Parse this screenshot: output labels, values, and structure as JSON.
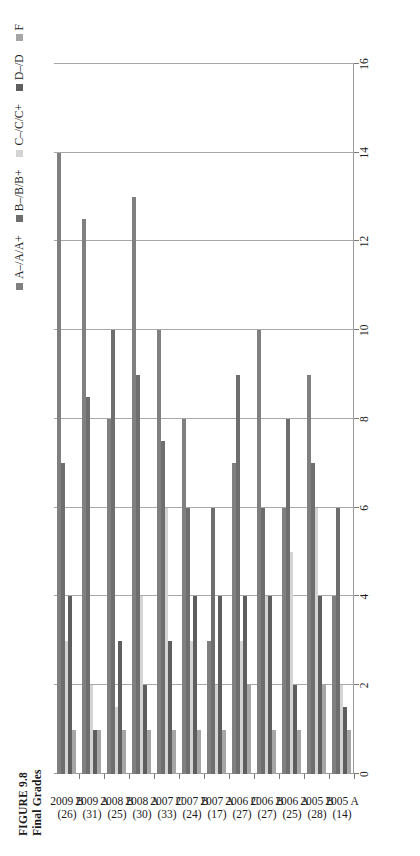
{
  "figure": {
    "number_label": "FIGURE 9.8",
    "title": "Final Grades"
  },
  "legend": {
    "position": "top-right",
    "items": [
      {
        "label": "A–/A/A+",
        "color": "#808080"
      },
      {
        "label": "B–/B/B+",
        "color": "#6e6e6e"
      },
      {
        "label": "C–/C/C+",
        "color": "#d4d4d4"
      },
      {
        "label": "D–/D",
        "color": "#5e5e5e"
      },
      {
        "label": "F",
        "color": "#a6a6a6"
      }
    ]
  },
  "axes": {
    "value_axis_ticks": [
      "0",
      "2",
      "4",
      "6",
      "8",
      "10",
      "12",
      "14",
      "16"
    ],
    "value_axis_min": 0,
    "value_axis_max": 16,
    "value_axis_step": 2,
    "grid": true,
    "orientation": "rotated-90"
  },
  "chart_data": {
    "type": "bar",
    "title": "Final Grades",
    "xlabel": "",
    "ylabel": "",
    "ylim": [
      0,
      16
    ],
    "grid": true,
    "legend_position": "top-right",
    "orientation": "horizontal-grouped",
    "categories": [
      "2005 A\n(14)",
      "2005 B\n(28)",
      "2006 A\n(25)",
      "2006 B\n(27)",
      "2006 C\n(27)",
      "2007 A\n(17)",
      "2007 B\n(24)",
      "2007 C\n(33)",
      "2008 A\n(30)",
      "2008 B\n(25)",
      "2009 A\n(31)",
      "2009 B\n(26)"
    ],
    "category_names": [
      "2005 A",
      "2005 B",
      "2006 A",
      "2006 B",
      "2006 C",
      "2007 A",
      "2007 B",
      "2007 C",
      "2008 A",
      "2008 B",
      "2009 A",
      "2009 B"
    ],
    "category_counts": [
      "(14)",
      "(28)",
      "(25)",
      "(27)",
      "(27)",
      "(17)",
      "(24)",
      "(33)",
      "(30)",
      "(25)",
      "(31)",
      "(26)"
    ],
    "series": [
      {
        "name": "A–/A/A+",
        "color": "#808080",
        "values": [
          4,
          9,
          6,
          10,
          7,
          3,
          8,
          10,
          13,
          8,
          12.5,
          14
        ]
      },
      {
        "name": "B–/B/B+",
        "color": "#6e6e6e",
        "values": [
          6,
          7,
          8,
          6,
          9,
          6,
          6,
          7.5,
          9,
          10,
          8.5,
          7
        ]
      },
      {
        "name": "C–/C/C+",
        "color": "#d4d4d4",
        "values": [
          2,
          6,
          5,
          4,
          3,
          2,
          3,
          6,
          4,
          1.5,
          2,
          3
        ]
      },
      {
        "name": "D–/D",
        "color": "#5e5e5e",
        "values": [
          1.5,
          4,
          2,
          4,
          4,
          4,
          4,
          3,
          2,
          3,
          1,
          4
        ]
      },
      {
        "name": "F",
        "color": "#a6a6a6",
        "values": [
          1,
          2,
          1,
          1,
          2,
          1,
          1,
          1,
          1,
          1,
          1,
          1
        ]
      }
    ]
  }
}
